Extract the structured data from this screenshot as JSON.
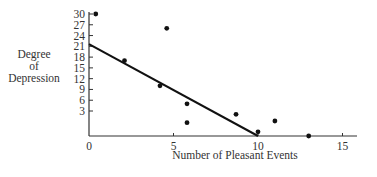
{
  "chart_data": {
    "type": "scatter",
    "title": "",
    "xlabel": "Number of Pleasant Events",
    "ylabel_lines": [
      "Degree",
      "of",
      "Depression"
    ],
    "x_ticks": [
      0,
      5,
      10,
      15
    ],
    "y_ticks": [
      30,
      27,
      24,
      21,
      18,
      15,
      12,
      9,
      6,
      3
    ],
    "xlim": [
      0,
      16
    ],
    "ylim": [
      0,
      30
    ],
    "grid": false,
    "legend": null,
    "series": [
      {
        "name": "observations",
        "kind": "scatter",
        "points": [
          {
            "x": 0.4,
            "y": 30
          },
          {
            "x": 2.1,
            "y": 17
          },
          {
            "x": 4.2,
            "y": 10
          },
          {
            "x": 4.6,
            "y": 26
          },
          {
            "x": 5.8,
            "y": 5
          },
          {
            "x": 5.8,
            "y": 1.6
          },
          {
            "x": 8.7,
            "y": 2.6
          },
          {
            "x": 10.0,
            "y": 0.5
          },
          {
            "x": 11.0,
            "y": 1.8
          },
          {
            "x": 13.0,
            "y": 0
          }
        ]
      },
      {
        "name": "regression line",
        "kind": "line",
        "points": [
          {
            "x": 0,
            "y": 21.6
          },
          {
            "x": 10,
            "y": 0
          }
        ]
      }
    ],
    "colors": {
      "axis": "#333333",
      "points": "#111111",
      "line": "#111111",
      "text": "#333333"
    }
  }
}
